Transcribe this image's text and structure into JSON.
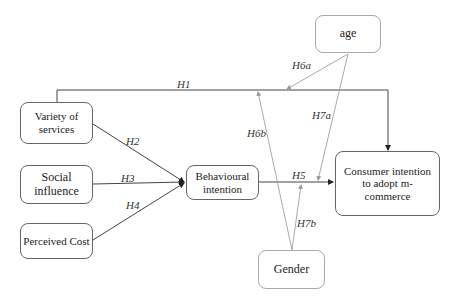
{
  "nodes": {
    "age": "age",
    "variety": "Variety of services",
    "social": "Social influence",
    "cost": "Perceived Cost",
    "behavioural": "Behavioural intention",
    "consumer": "Consumer intention to adopt m-commerce",
    "gender": "Gender"
  },
  "hypotheses": {
    "h1": "H1",
    "h2": "H2",
    "h3": "H3",
    "h4": "H4",
    "h5": "H5",
    "h6a": "H6a",
    "h6b": "H6b",
    "h7a": "H7a",
    "h7b": "H7b"
  }
}
